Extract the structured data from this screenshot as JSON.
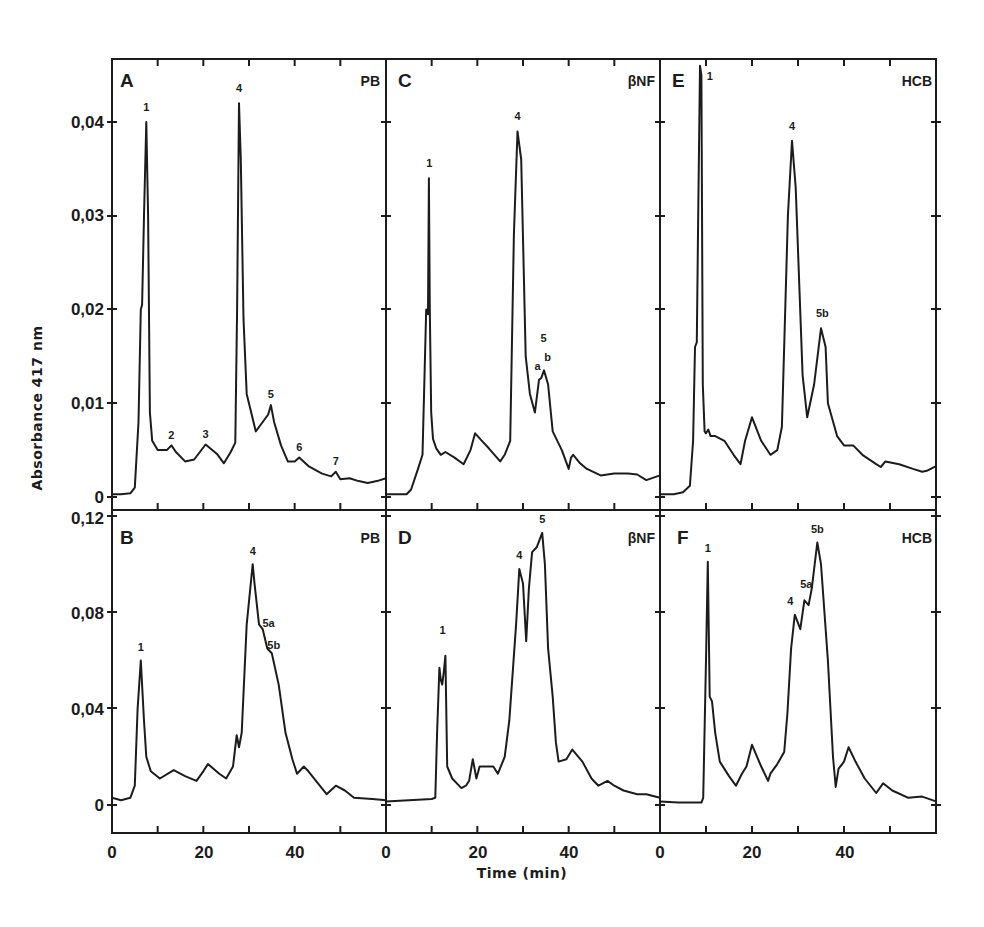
{
  "figure": {
    "y_axis_title": "Absorbance  417 nm",
    "x_axis_title": "Time (min)",
    "x_tick_labels": [
      "0",
      "20",
      "40"
    ],
    "top_row_y_tick_labels": [
      "0,04",
      "0,03",
      "0,02",
      "0,01",
      "0"
    ],
    "bottom_row_y_tick_labels": [
      "0,12",
      "0,08",
      "0,04",
      "0"
    ]
  },
  "chart_data": [
    {
      "type": "line",
      "panel": "A",
      "tag": "PB",
      "title": "",
      "xlabel": "Time (min)",
      "ylabel": "Absorbance 417 nm",
      "xlim": [
        0,
        60
      ],
      "ylim": [
        0,
        0.04
      ],
      "x": [
        0,
        2,
        4,
        5,
        5.8,
        6.3,
        6.6,
        7.0,
        7.5,
        7.9,
        8.3,
        8.8,
        10,
        12,
        13,
        14,
        16,
        18,
        20.5,
        23,
        24.5,
        26,
        27,
        27.4,
        27.8,
        28.2,
        28.8,
        29.5,
        31.5,
        33,
        34.2,
        34.8,
        35.5,
        37,
        38.5,
        40,
        41,
        43,
        46,
        48,
        49,
        50,
        52,
        54,
        56,
        58,
        60
      ],
      "values": [
        0.0003,
        0.0003,
        0.0004,
        0.001,
        0.008,
        0.02,
        0.0205,
        0.03,
        0.04,
        0.03,
        0.009,
        0.006,
        0.005,
        0.005,
        0.0055,
        0.0048,
        0.0038,
        0.004,
        0.0056,
        0.0046,
        0.0036,
        0.0048,
        0.0058,
        0.02,
        0.042,
        0.036,
        0.019,
        0.011,
        0.007,
        0.008,
        0.0088,
        0.0098,
        0.008,
        0.0055,
        0.0038,
        0.0038,
        0.0042,
        0.0033,
        0.0025,
        0.0022,
        0.0027,
        0.0019,
        0.002,
        0.0017,
        0.0015,
        0.0017,
        0.002
      ],
      "peak_labels": [
        {
          "text": "1",
          "x": 7.5,
          "y": 0.0412
        },
        {
          "text": "2",
          "x": 13,
          "y": 0.0062
        },
        {
          "text": "3",
          "x": 20.5,
          "y": 0.0063
        },
        {
          "text": "4",
          "x": 27.8,
          "y": 0.0432
        },
        {
          "text": "5",
          "x": 34.8,
          "y": 0.0106
        },
        {
          "text": "6",
          "x": 41,
          "y": 0.0049
        },
        {
          "text": "7",
          "x": 49,
          "y": 0.0034
        }
      ]
    },
    {
      "type": "line",
      "panel": "B",
      "tag": "PB",
      "title": "",
      "xlabel": "Time (min)",
      "ylabel": "Absorbance 417 nm",
      "xlim": [
        0,
        60
      ],
      "ylim": [
        0,
        0.12
      ],
      "x": [
        0,
        1,
        2,
        3,
        4,
        5,
        5.6,
        6.3,
        7.0,
        7.5,
        8.5,
        10.5,
        13.5,
        16,
        18.5,
        20,
        21,
        23.5,
        25,
        26.5,
        27.3,
        27.8,
        28.4,
        29.5,
        30.8,
        31.2,
        32.2,
        33,
        34,
        35,
        36.5,
        38,
        39.5,
        40.5,
        42,
        43,
        45.5,
        47,
        49,
        51,
        53,
        57,
        60
      ],
      "values": [
        0.003,
        0.0025,
        0.002,
        0.0025,
        0.003,
        0.008,
        0.04,
        0.06,
        0.035,
        0.02,
        0.014,
        0.011,
        0.0145,
        0.012,
        0.01,
        0.014,
        0.017,
        0.013,
        0.011,
        0.016,
        0.029,
        0.024,
        0.03,
        0.075,
        0.1,
        0.092,
        0.075,
        0.073,
        0.065,
        0.063,
        0.05,
        0.03,
        0.019,
        0.013,
        0.016,
        0.014,
        0.008,
        0.0045,
        0.008,
        0.006,
        0.003,
        0.0025,
        0.002
      ],
      "peak_labels": [
        {
          "text": "1",
          "x": 6.3,
          "y": 0.064
        },
        {
          "text": "4",
          "x": 30.8,
          "y": 0.104
        },
        {
          "text": "5a",
          "x": 34.3,
          "y": 0.074
        },
        {
          "text": "5b",
          "x": 35.4,
          "y": 0.065
        }
      ]
    },
    {
      "type": "line",
      "panel": "C",
      "tag": "βNF",
      "title": "",
      "xlabel": "Time (min)",
      "ylabel": "Absorbance 417 nm",
      "xlim": [
        0,
        60
      ],
      "ylim": [
        0,
        0.04
      ],
      "x": [
        0,
        3,
        4.5,
        5.5,
        7,
        8,
        8.8,
        9.2,
        9.4,
        9.6,
        9.9,
        10.3,
        11,
        12,
        13,
        15,
        17,
        18.5,
        19.5,
        21,
        22.5,
        25,
        26,
        27.2,
        28,
        28.8,
        29.6,
        30.6,
        31.5,
        32.6,
        33.5,
        34,
        34.6,
        35.5,
        36.5,
        38.5,
        40,
        40.5,
        41,
        42.5,
        44,
        47,
        50,
        53,
        55,
        57,
        60
      ],
      "values": [
        0.0003,
        0.0003,
        0.0003,
        0.0008,
        0.003,
        0.0045,
        0.02,
        0.0195,
        0.034,
        0.02,
        0.009,
        0.0062,
        0.0052,
        0.0045,
        0.0048,
        0.0042,
        0.0035,
        0.005,
        0.0068,
        0.006,
        0.0052,
        0.0038,
        0.0045,
        0.006,
        0.028,
        0.039,
        0.036,
        0.015,
        0.011,
        0.009,
        0.0125,
        0.0127,
        0.0135,
        0.012,
        0.007,
        0.005,
        0.003,
        0.0042,
        0.0045,
        0.0036,
        0.003,
        0.0023,
        0.0025,
        0.0025,
        0.0024,
        0.0018,
        0.0023
      ],
      "peak_labels": [
        {
          "text": "1",
          "x": 9.5,
          "y": 0.0352
        },
        {
          "text": "4",
          "x": 28.8,
          "y": 0.0402
        },
        {
          "text": "a",
          "x": 33.2,
          "y": 0.0135
        },
        {
          "text": "5",
          "x": 34.5,
          "y": 0.0165
        },
        {
          "text": "b",
          "x": 35.4,
          "y": 0.0145
        }
      ]
    },
    {
      "type": "line",
      "panel": "D",
      "tag": "βNF",
      "title": "",
      "xlabel": "Time (min)",
      "ylabel": "Absorbance 417 nm",
      "xlim": [
        0,
        60
      ],
      "ylim": [
        0,
        0.12
      ],
      "x": [
        0,
        5,
        10,
        10.8,
        11.2,
        11.7,
        12.0,
        12.3,
        12.7,
        13.0,
        13.4,
        14.5,
        16.5,
        17.5,
        18.2,
        19.0,
        19.8,
        20.5,
        21.5,
        23.5,
        24.5,
        26,
        27,
        28.5,
        29.2,
        30.0,
        30.7,
        31.3,
        32,
        33,
        34.2,
        34.8,
        35.5,
        36.5,
        37.2,
        37.8,
        39.5,
        40.8,
        43,
        45,
        46.5,
        48.5,
        50,
        52,
        55,
        57,
        60
      ],
      "values": [
        0.0015,
        0.002,
        0.0025,
        0.003,
        0.03,
        0.057,
        0.052,
        0.05,
        0.056,
        0.062,
        0.016,
        0.011,
        0.007,
        0.008,
        0.01,
        0.019,
        0.011,
        0.016,
        0.016,
        0.016,
        0.013,
        0.02,
        0.035,
        0.075,
        0.098,
        0.092,
        0.068,
        0.09,
        0.105,
        0.107,
        0.113,
        0.1,
        0.065,
        0.045,
        0.026,
        0.018,
        0.019,
        0.023,
        0.018,
        0.011,
        0.008,
        0.01,
        0.008,
        0.006,
        0.0045,
        0.0045,
        0.003
      ],
      "peak_labels": [
        {
          "text": "1",
          "x": 12.4,
          "y": 0.071
        },
        {
          "text": "4",
          "x": 29.2,
          "y": 0.102
        },
        {
          "text": "5",
          "x": 34.2,
          "y": 0.117
        }
      ]
    },
    {
      "type": "line",
      "panel": "E",
      "tag": "HCB",
      "title": "",
      "xlabel": "Time (min)",
      "ylabel": "Absorbance 417 nm",
      "xlim": [
        0,
        60
      ],
      "ylim": [
        0,
        0.04
      ],
      "x": [
        0,
        3,
        5,
        6.5,
        7.2,
        7.6,
        8.0,
        8.3,
        8.7,
        9.0,
        9.3,
        9.7,
        10.0,
        10.5,
        11,
        12,
        14,
        16,
        17.5,
        18.5,
        20,
        22,
        24,
        25.5,
        26.5,
        27.8,
        28.7,
        29.5,
        31,
        32,
        33.5,
        35,
        36,
        36.5,
        38.5,
        40,
        42,
        44,
        47,
        48,
        49,
        52,
        55,
        57,
        58,
        60
      ],
      "values": [
        0.0003,
        0.0003,
        0.0005,
        0.0012,
        0.006,
        0.016,
        0.0165,
        0.03,
        0.046,
        0.045,
        0.012,
        0.007,
        0.0068,
        0.0072,
        0.0065,
        0.0065,
        0.006,
        0.0045,
        0.0035,
        0.006,
        0.0085,
        0.006,
        0.0045,
        0.005,
        0.0075,
        0.03,
        0.038,
        0.033,
        0.013,
        0.0085,
        0.012,
        0.018,
        0.016,
        0.01,
        0.0065,
        0.0055,
        0.0055,
        0.0045,
        0.0035,
        0.0032,
        0.0038,
        0.0035,
        0.003,
        0.0027,
        0.0028,
        0.0033
      ],
      "peak_labels": [
        {
          "text": "1",
          "x": 10.8,
          "y": 0.0445
        },
        {
          "text": "4",
          "x": 28.7,
          "y": 0.0392
        },
        {
          "text": "5b",
          "x": 35.3,
          "y": 0.0192
        }
      ]
    },
    {
      "type": "line",
      "panel": "F",
      "tag": "HCB",
      "title": "",
      "xlabel": "Time (min)",
      "ylabel": "Absorbance 417 nm",
      "xlim": [
        0,
        60
      ],
      "ylim": [
        0,
        0.12
      ],
      "x": [
        0,
        4,
        9,
        9.4,
        10.0,
        10.4,
        10.8,
        11.3,
        12,
        13,
        15,
        16.5,
        17.8,
        18.8,
        20,
        22,
        23.5,
        24,
        25.5,
        27,
        27.7,
        28.5,
        29.3,
        30.5,
        31.4,
        32.3,
        33,
        34.2,
        35,
        36.5,
        37.6,
        38.2,
        38.8,
        40,
        41,
        42.5,
        44.5,
        47,
        48.5,
        50.5,
        54,
        57,
        60
      ],
      "values": [
        0.0015,
        0.001,
        0.001,
        0.003,
        0.06,
        0.101,
        0.045,
        0.043,
        0.03,
        0.018,
        0.012,
        0.008,
        0.013,
        0.016,
        0.025,
        0.016,
        0.01,
        0.013,
        0.017,
        0.022,
        0.038,
        0.065,
        0.079,
        0.073,
        0.085,
        0.083,
        0.09,
        0.109,
        0.1,
        0.06,
        0.02,
        0.0075,
        0.015,
        0.018,
        0.024,
        0.018,
        0.011,
        0.005,
        0.009,
        0.006,
        0.003,
        0.0035,
        0.0015
      ],
      "peak_labels": [
        {
          "text": "1",
          "x": 10.4,
          "y": 0.105
        },
        {
          "text": "4",
          "x": 28.3,
          "y": 0.083
        },
        {
          "text": "5a",
          "x": 31.8,
          "y": 0.09
        },
        {
          "text": "5b",
          "x": 34.2,
          "y": 0.113
        }
      ]
    }
  ]
}
